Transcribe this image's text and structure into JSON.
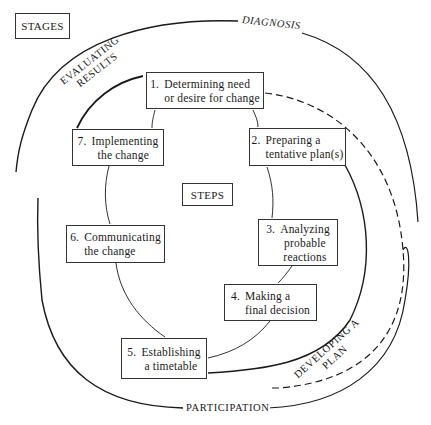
{
  "legend": {
    "stages_label": "STAGES",
    "steps_label": "STEPS"
  },
  "stages": {
    "diagnosis": "DIAGNOSIS",
    "evaluating_results_line1": "EVALUATING",
    "evaluating_results_line2": "RESULTS",
    "developing_plan_line1": "DEVELOPING A",
    "developing_plan_line2": "PLAN",
    "participation": "PARTICIPATION"
  },
  "steps": [
    {
      "num": "1.",
      "line1": "Determining need",
      "line2": "or desire for change"
    },
    {
      "num": "2.",
      "line1": "Preparing a",
      "line2": "tentative plan(s)"
    },
    {
      "num": "3.",
      "line1": "Analyzing",
      "line2": "probable",
      "line3": "reactions"
    },
    {
      "num": "4.",
      "line1": "Making a",
      "line2": "final decision"
    },
    {
      "num": "5.",
      "line1": "Establishing",
      "line2": "a timetable"
    },
    {
      "num": "6.",
      "line1": "Communicating",
      "line2": "the change"
    },
    {
      "num": "7.",
      "line1": "Implementing",
      "line2": "the change"
    }
  ],
  "colors": {
    "line": "#1a1a1a",
    "box_border": "#333333",
    "background": "#ffffff"
  }
}
